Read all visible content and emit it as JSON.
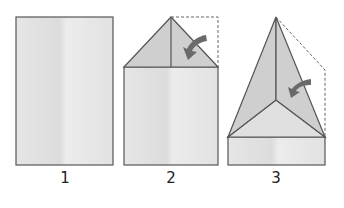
{
  "steps": [
    {
      "number": "1",
      "description": "Start with a rectangular sheet of paper"
    },
    {
      "number": "2",
      "description": "Fold top corners down to the center crease"
    },
    {
      "number": "3",
      "description": "Fold the new edges down to the center crease again"
    }
  ],
  "colors": {
    "paper": "#e2e2e2",
    "folded": "#cfcfcf",
    "outline": "#555555",
    "arrow": "#6a6a6a",
    "dashed": "#666666"
  }
}
